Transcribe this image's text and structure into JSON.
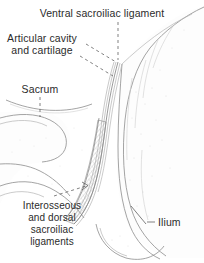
{
  "figure": {
    "name": "sacroiliac-joint-coronal-section",
    "background_color": "#ffffff",
    "ink_color": "#2b2b2b",
    "line_color": "#8d8d8d"
  },
  "labels": {
    "ventral_ligament": "Ventral sacroiliac ligament",
    "articular_cavity_line1": "Articular cavity",
    "articular_cavity_line2": "and cartilage",
    "sacrum": "Sacrum",
    "interosseous_line1": "Interosseous",
    "interosseous_line2": "and dorsal",
    "interosseous_line3": "sacroiliac",
    "interosseous_line4": "ligaments",
    "ilium": "Ilium"
  },
  "structures": [
    {
      "name": "sacrum",
      "side": "left"
    },
    {
      "name": "ilium",
      "side": "right"
    },
    {
      "name": "articular-cavity",
      "side": "center"
    },
    {
      "name": "interosseous-dorsal-sacroiliac-ligaments",
      "side": "center"
    },
    {
      "name": "ventral-sacroiliac-ligament",
      "side": "top-center"
    }
  ]
}
